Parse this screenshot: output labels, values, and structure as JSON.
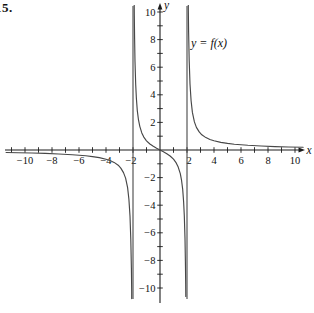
{
  "figure": {
    "problem_number": "15.",
    "curve_label": "y = f(x)",
    "x_axis_label": "x",
    "y_axis_label": "y"
  },
  "chart_data": {
    "type": "line",
    "function": "f(x) = 2x/(x^2-4)",
    "xlabel": "x",
    "ylabel": "y",
    "xlim": [
      -11.5,
      11.5
    ],
    "ylim": [
      -10.9,
      10.9
    ],
    "grid": false,
    "legend": "none",
    "tick_step": 1,
    "label_step": 2,
    "vertical_asymptotes": [
      -2,
      2
    ],
    "horizontal_asymptote": 0,
    "x_minor_ticks": [
      -11,
      -10,
      -9,
      -8,
      -7,
      -6,
      -5,
      -4,
      -3,
      -2,
      -1,
      1,
      2,
      3,
      4,
      5,
      6,
      7,
      8,
      9,
      10
    ],
    "y_minor_ticks": [
      -10,
      -9,
      -8,
      -7,
      -6,
      -5,
      -4,
      -3,
      -2,
      -1,
      1,
      2,
      3,
      4,
      5,
      6,
      7,
      8,
      9,
      10
    ],
    "x_tick_labels": [
      {
        "v": -10,
        "t": "−10",
        "dx": 0
      },
      {
        "v": -8,
        "t": "−8",
        "dx": 0
      },
      {
        "v": -6,
        "t": "−6",
        "dx": 0
      },
      {
        "v": -4,
        "t": "−4",
        "dx": 0
      },
      {
        "v": -2,
        "t": "−2",
        "dx": -2
      },
      {
        "v": 2,
        "t": "2",
        "dx": 2
      },
      {
        "v": 4,
        "t": "4",
        "dx": 0
      },
      {
        "v": 6,
        "t": "6",
        "dx": 0
      },
      {
        "v": 8,
        "t": "8",
        "dx": 0
      },
      {
        "v": 10,
        "t": "10",
        "dx": 0
      }
    ],
    "y_tick_labels": [
      {
        "v": 10,
        "t": "10"
      },
      {
        "v": 8,
        "t": "8"
      },
      {
        "v": 6,
        "t": "6"
      },
      {
        "v": 4,
        "t": "4"
      },
      {
        "v": 2,
        "t": "2"
      },
      {
        "v": -2,
        "t": "−2"
      },
      {
        "v": -4,
        "t": "−4"
      },
      {
        "v": -6,
        "t": "−6"
      },
      {
        "v": -8,
        "t": "−8"
      },
      {
        "v": -10,
        "t": "−10"
      }
    ],
    "series": [
      {
        "name": "branch-left",
        "points": [
          [
            -11.4,
            -0.181
          ],
          [
            -10.5,
            -0.198
          ],
          [
            -9.5,
            -0.22
          ],
          [
            -8.5,
            -0.249
          ],
          [
            -7.5,
            -0.287
          ],
          [
            -6.5,
            -0.34
          ],
          [
            -5.5,
            -0.419
          ],
          [
            -5,
            -0.476
          ],
          [
            -4.5,
            -0.554
          ],
          [
            -4,
            -0.667
          ],
          [
            -3.7,
            -0.764
          ],
          [
            -3.4,
            -0.9
          ],
          [
            -3.1,
            -1.105
          ],
          [
            -2.9,
            -1.315
          ],
          [
            -2.7,
            -1.641
          ],
          [
            -2.55,
            -2.038
          ],
          [
            -2.4,
            -2.727
          ],
          [
            -2.3,
            -3.566
          ],
          [
            -2.22,
            -4.782
          ],
          [
            -2.16,
            -6.491
          ],
          [
            -2.12,
            -8.576
          ],
          [
            -2.1,
            -10.244
          ],
          [
            -2.095,
            -10.771
          ]
        ]
      },
      {
        "name": "branch-middle",
        "points": [
          [
            -1.908,
            10.615
          ],
          [
            -1.9,
            9.744
          ],
          [
            -1.88,
            8.076
          ],
          [
            -1.85,
            6.407
          ],
          [
            -1.8,
            4.737
          ],
          [
            -1.75,
            3.733
          ],
          [
            -1.68,
            2.853
          ],
          [
            -1.6,
            2.222
          ],
          [
            -1.5,
            1.714
          ],
          [
            -1.35,
            1.24
          ],
          [
            -1.2,
            0.938
          ],
          [
            -1,
            0.667
          ],
          [
            -0.75,
            0.436
          ],
          [
            -0.5,
            0.267
          ],
          [
            -0.25,
            0.127
          ],
          [
            0,
            0
          ],
          [
            0.25,
            -0.127
          ],
          [
            0.5,
            -0.267
          ],
          [
            0.75,
            -0.436
          ],
          [
            1,
            -0.667
          ],
          [
            1.2,
            -0.938
          ],
          [
            1.35,
            -1.24
          ],
          [
            1.5,
            -1.714
          ],
          [
            1.6,
            -2.222
          ],
          [
            1.68,
            -2.853
          ],
          [
            1.75,
            -3.733
          ],
          [
            1.8,
            -4.737
          ],
          [
            1.85,
            -6.407
          ],
          [
            1.88,
            -8.076
          ],
          [
            1.9,
            -9.744
          ],
          [
            1.908,
            -10.615
          ]
        ]
      },
      {
        "name": "branch-right",
        "points": [
          [
            2.095,
            10.771
          ],
          [
            2.1,
            10.244
          ],
          [
            2.12,
            8.576
          ],
          [
            2.16,
            6.491
          ],
          [
            2.22,
            4.782
          ],
          [
            2.3,
            3.566
          ],
          [
            2.4,
            2.727
          ],
          [
            2.55,
            2.038
          ],
          [
            2.7,
            1.641
          ],
          [
            2.9,
            1.315
          ],
          [
            3.1,
            1.105
          ],
          [
            3.4,
            0.9
          ],
          [
            3.7,
            0.764
          ],
          [
            4,
            0.667
          ],
          [
            4.5,
            0.554
          ],
          [
            5,
            0.476
          ],
          [
            5.5,
            0.419
          ],
          [
            6.5,
            0.34
          ],
          [
            7.5,
            0.287
          ],
          [
            8.5,
            0.249
          ],
          [
            9.5,
            0.22
          ],
          [
            10.6,
            0.196
          ]
        ]
      }
    ],
    "colors": {
      "curve": "#474747",
      "asymptote": "#474747",
      "axis": "#1c1c1c",
      "text": "#111111",
      "background": "#ffffff"
    }
  }
}
